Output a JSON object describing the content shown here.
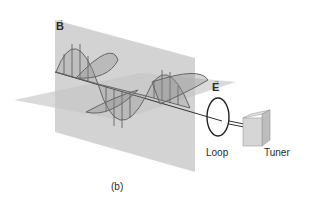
{
  "figure": {
    "caption": "(b)"
  },
  "labels": {
    "magnetic_field": "B",
    "magnetic_field_arrow": "→",
    "electric_field": "E",
    "electric_field_arrow": "→",
    "loop": "Loop",
    "tuner": "Tuner"
  },
  "colors": {
    "background": "#ffffff",
    "plane_fill": "#c9c9c9",
    "wave_stroke": "#6a6a6a",
    "wave_fill": "#9a9a9a",
    "text": "#2a2a2a"
  }
}
